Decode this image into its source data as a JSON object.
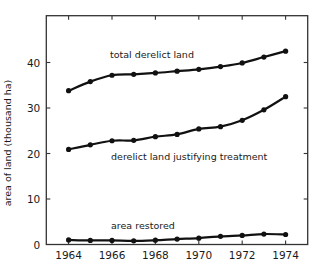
{
  "chart_data": {
    "type": "line",
    "title": "",
    "xlabel": "",
    "ylabel": "area of land (thousand ha)",
    "x": [
      1964,
      1965,
      1966,
      1967,
      1968,
      1969,
      1970,
      1971,
      1972,
      1973,
      1974
    ],
    "xlim": [
      1963,
      1975
    ],
    "ylim": [
      0,
      48
    ],
    "xticks": [
      1964,
      1966,
      1968,
      1970,
      1972,
      1974
    ],
    "xtick_labels": [
      "1964",
      "1966",
      "1968",
      "1970",
      "1972",
      "1974"
    ],
    "yticks": [
      0,
      10,
      20,
      30,
      40
    ],
    "ytick_labels": [
      "0",
      "10",
      "20",
      "30",
      "40"
    ],
    "grid": false,
    "legend": "none (series labelled inline)",
    "series": [
      {
        "name": "total derelict land",
        "values": [
          33.8,
          35.8,
          37.2,
          37.4,
          37.7,
          38.1,
          38.5,
          39.1,
          39.9,
          41.2,
          42.5
        ]
      },
      {
        "name": "derelict land justifying treatment",
        "values": [
          20.9,
          21.9,
          22.8,
          22.9,
          23.7,
          24.2,
          25.4,
          25.9,
          27.3,
          29.6,
          32.5
        ]
      },
      {
        "name": "area restored",
        "values": [
          1.0,
          0.9,
          0.9,
          0.8,
          0.95,
          1.2,
          1.4,
          1.8,
          2.0,
          2.3,
          2.2
        ]
      }
    ],
    "annotations": [
      {
        "text": "total derelict land",
        "series": 0
      },
      {
        "text": "derelict land justifying treatment",
        "series": 1
      },
      {
        "text": "area restored",
        "series": 2
      }
    ]
  },
  "labels": {
    "ylabel": "area of land (thousand ha)",
    "series0": "total derelict land",
    "series1": "derelict land justifying treatment",
    "series2": "area restored"
  },
  "colors": {
    "line": "#111111",
    "axis": "#333333",
    "background": "#ffffff"
  }
}
